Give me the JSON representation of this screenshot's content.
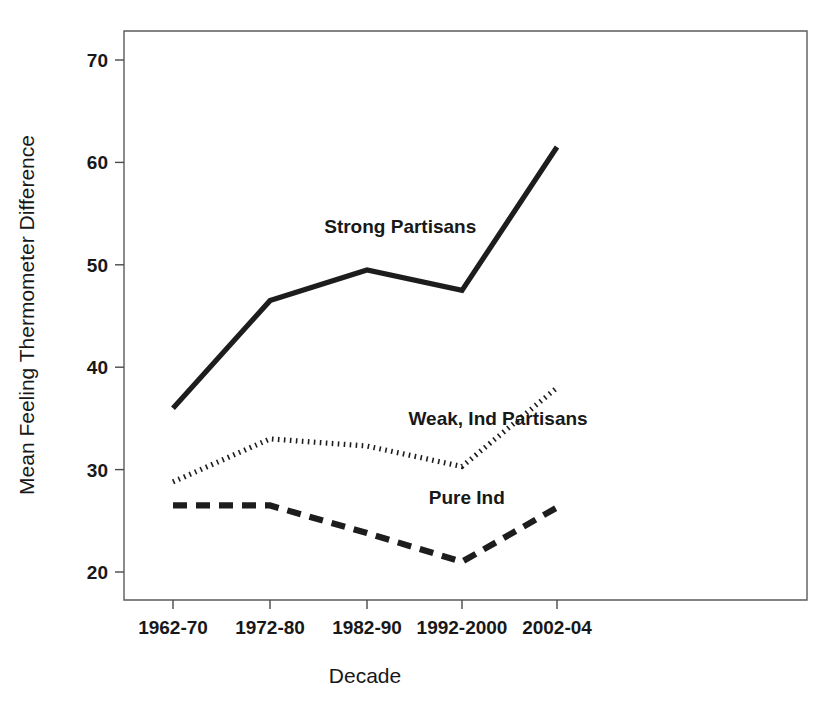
{
  "chart_data": {
    "type": "line",
    "title": "",
    "xlabel": "Decade",
    "ylabel": "Mean Feeling Thermometer Difference",
    "categories": [
      "1962-70",
      "1972-80",
      "1982-90",
      "1992-2000",
      "2002-04"
    ],
    "ylim": [
      17,
      73
    ],
    "yticks": [
      20,
      30,
      40,
      50,
      60,
      70
    ],
    "ytick_labels": [
      "20",
      "30",
      "40",
      "50",
      "60",
      "70"
    ],
    "grid": false,
    "legend_position": "inline-annotations",
    "series": [
      {
        "name": "Strong Partisans",
        "style": "solid",
        "values": [
          36.0,
          46.5,
          49.5,
          47.5,
          61.5
        ]
      },
      {
        "name": "Weak, Ind Partisans",
        "style": "dotted",
        "values": [
          28.8,
          33.0,
          32.3,
          30.3,
          38.0
        ]
      },
      {
        "name": "Pure Ind",
        "style": "dashed",
        "values": [
          26.5,
          26.5,
          23.8,
          21.0,
          26.3
        ]
      }
    ],
    "annotations": [
      {
        "text": "Strong Partisans",
        "x_value": 2.35,
        "y_value": 53.8
      },
      {
        "text": "Weak, Ind Partisans",
        "x_value": 3.38,
        "y_value": 35.0
      },
      {
        "text": "Pure Ind",
        "x_value": 3.05,
        "y_value": 27.3
      }
    ]
  }
}
